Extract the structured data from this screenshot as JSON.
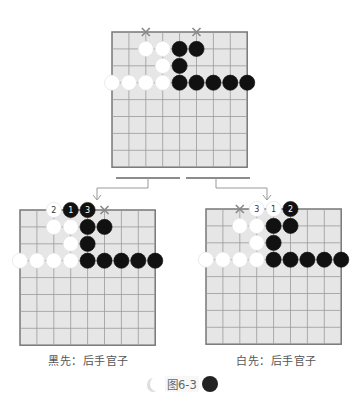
{
  "figure_label": "图6-3",
  "boards": [
    {
      "id": "top",
      "caption": "",
      "grid_size": 8,
      "stones": [
        {
          "color": "white",
          "col": 2,
          "row": 1
        },
        {
          "color": "white",
          "col": 3,
          "row": 1
        },
        {
          "color": "black",
          "col": 4,
          "row": 1
        },
        {
          "color": "black",
          "col": 5,
          "row": 1
        },
        {
          "color": "white",
          "col": 3,
          "row": 2
        },
        {
          "color": "black",
          "col": 4,
          "row": 2
        },
        {
          "color": "white",
          "col": 0,
          "row": 3
        },
        {
          "color": "white",
          "col": 1,
          "row": 3
        },
        {
          "color": "white",
          "col": 2,
          "row": 3
        },
        {
          "color": "white",
          "col": 3,
          "row": 3
        },
        {
          "color": "black",
          "col": 4,
          "row": 3
        },
        {
          "color": "black",
          "col": 5,
          "row": 3
        },
        {
          "color": "black",
          "col": 6,
          "row": 3
        },
        {
          "color": "black",
          "col": 7,
          "row": 3
        },
        {
          "color": "black",
          "col": 8,
          "row": 3
        }
      ],
      "marks": [
        {
          "type": "x",
          "col": 2,
          "row": 0
        },
        {
          "type": "x",
          "col": 5,
          "row": 0
        }
      ]
    },
    {
      "id": "left",
      "caption": "黑先：后手官子",
      "grid_size": 8,
      "stones": [
        {
          "color": "white",
          "col": 2,
          "row": 0,
          "label": "2"
        },
        {
          "color": "black",
          "col": 3,
          "row": 0,
          "label": "1"
        },
        {
          "color": "black",
          "col": 4,
          "row": 0,
          "label": "3"
        },
        {
          "color": "white",
          "col": 2,
          "row": 1
        },
        {
          "color": "white",
          "col": 3,
          "row": 1
        },
        {
          "color": "black",
          "col": 4,
          "row": 1
        },
        {
          "color": "black",
          "col": 5,
          "row": 1
        },
        {
          "color": "white",
          "col": 3,
          "row": 2
        },
        {
          "color": "black",
          "col": 4,
          "row": 2
        },
        {
          "color": "white",
          "col": 0,
          "row": 3
        },
        {
          "color": "white",
          "col": 1,
          "row": 3
        },
        {
          "color": "white",
          "col": 2,
          "row": 3
        },
        {
          "color": "white",
          "col": 3,
          "row": 3
        },
        {
          "color": "black",
          "col": 4,
          "row": 3
        },
        {
          "color": "black",
          "col": 5,
          "row": 3
        },
        {
          "color": "black",
          "col": 6,
          "row": 3
        },
        {
          "color": "black",
          "col": 7,
          "row": 3
        },
        {
          "color": "black",
          "col": 8,
          "row": 3
        }
      ],
      "marks": [
        {
          "type": "x",
          "col": 5,
          "row": 0
        }
      ]
    },
    {
      "id": "right",
      "caption": "白先：后手官子",
      "grid_size": 8,
      "stones": [
        {
          "color": "white",
          "col": 3,
          "row": 0,
          "label": "3"
        },
        {
          "color": "white",
          "col": 4,
          "row": 0,
          "label": "1"
        },
        {
          "color": "black",
          "col": 5,
          "row": 0,
          "label": "2"
        },
        {
          "color": "white",
          "col": 2,
          "row": 1
        },
        {
          "color": "white",
          "col": 3,
          "row": 1
        },
        {
          "color": "black",
          "col": 4,
          "row": 1
        },
        {
          "color": "black",
          "col": 5,
          "row": 1
        },
        {
          "color": "white",
          "col": 3,
          "row": 2
        },
        {
          "color": "black",
          "col": 4,
          "row": 2
        },
        {
          "color": "white",
          "col": 0,
          "row": 3
        },
        {
          "color": "white",
          "col": 1,
          "row": 3
        },
        {
          "color": "white",
          "col": 2,
          "row": 3
        },
        {
          "color": "white",
          "col": 3,
          "row": 3
        },
        {
          "color": "black",
          "col": 4,
          "row": 3
        },
        {
          "color": "black",
          "col": 5,
          "row": 3
        },
        {
          "color": "black",
          "col": 6,
          "row": 3
        },
        {
          "color": "black",
          "col": 7,
          "row": 3
        },
        {
          "color": "black",
          "col": 8,
          "row": 3
        }
      ],
      "marks": [
        {
          "type": "x",
          "col": 2,
          "row": 0
        }
      ]
    }
  ],
  "colors": {
    "board_fill": "#e6e6e6",
    "board_line": "#9a9a9a",
    "board_border": "#777777",
    "black_stone": "#111111",
    "white_stone": "#ffffff",
    "mark": "#888888"
  }
}
